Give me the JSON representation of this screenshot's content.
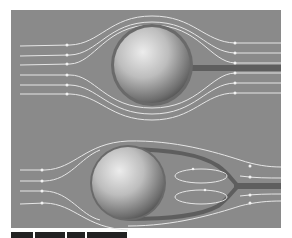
{
  "figure": {
    "type": "flow-around-sphere diagram",
    "panel_color": "#8a8a8a",
    "streamline_color": "#e8e8e8",
    "wake_color": "#5e5e5e",
    "sphere_highlight": "#e6e6e6",
    "sphere_shadow": "#4a4a4a",
    "panels": [
      {
        "id": "top",
        "description": "Attached flow around a sphere with thin wake",
        "sphere": {
          "cx": 152,
          "cy": 65,
          "r": 38
        },
        "streamline_count": 6,
        "wake": {
          "x1": 190,
          "x2": 281,
          "y": 68
        },
        "vortices": 0
      },
      {
        "id": "bottom",
        "description": "Separated flow around a sphere with recirculation region",
        "sphere": {
          "cx": 128,
          "cy": 183,
          "r": 36
        },
        "streamline_count": 6,
        "wake": {
          "x1": 235,
          "x2": 281,
          "y": 186
        },
        "vortices": 2
      }
    ]
  },
  "caption": {
    "visible": "clipped",
    "text": ""
  }
}
